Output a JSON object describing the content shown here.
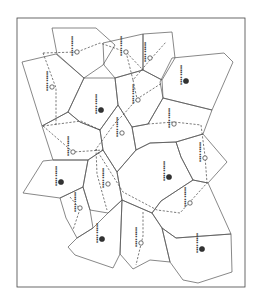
{
  "figure": {
    "frame": {
      "x": 17,
      "y": 18,
      "width": 228,
      "height": 269
    },
    "colors": {
      "line": "#555555",
      "dash": "#444444",
      "marker_fill": "#333333",
      "background": "#ffffff"
    }
  },
  "cells": [
    {
      "id": "c1",
      "points": "52,28 96,28 115,45 103,65 84,78 57,54"
    },
    {
      "id": "c2",
      "points": "103,43 143,34 143,70 115,78 104,65"
    },
    {
      "id": "c3",
      "points": "143,34 172,32 175,58 162,80 143,70"
    },
    {
      "id": "c4",
      "points": "172,58 224,53 233,62 212,110 163,98 160,82"
    },
    {
      "id": "c5",
      "points": "22,62 56,54 84,78 68,112 42,126"
    },
    {
      "id": "c6",
      "points": "84,78 115,78 118,105 100,130 80,122 68,112"
    },
    {
      "id": "c7",
      "points": "115,78 143,70 162,80 163,98 148,124 132,127 118,105"
    },
    {
      "id": "c8",
      "points": "42,126 68,112 80,122 100,130 103,150 88,160 53,160"
    },
    {
      "id": "c9",
      "points": "100,130 118,105 132,127 136,150 117,172 103,150"
    },
    {
      "id": "c10",
      "points": "132,127 148,124 163,98 212,110 203,134 176,142 150,143 136,150"
    },
    {
      "id": "c11",
      "points": "176,142 203,134 227,162 208,183 193,180 181,157"
    },
    {
      "id": "c12",
      "points": "23,193 43,161 53,160 88,160 83,187 60,198"
    },
    {
      "id": "c13",
      "points": "88,160 103,150 117,172 122,200 108,213 90,210 83,187"
    },
    {
      "id": "c14",
      "points": "117,172 136,150 150,143 176,142 181,157 193,180 161,201 152,213 122,200"
    },
    {
      "id": "c15",
      "points": "60,198 83,187 90,210 93,228 77,238 66,218"
    },
    {
      "id": "c16",
      "points": "161,201 193,180 208,183 231,234 176,238 162,228 152,213"
    },
    {
      "id": "c17",
      "points": "77,238 93,228 108,213 122,200 120,254 113,268 75,255 68,247"
    },
    {
      "id": "c18",
      "points": "122,200 152,213 162,228 170,262 150,260 133,269 120,254"
    },
    {
      "id": "c19",
      "points": "162,228 176,238 231,234 232,272 198,283 183,280 170,262"
    }
  ],
  "links": [
    {
      "points": "43,53 77,52 100,43 126,52 143,70"
    },
    {
      "points": "43,53 56,88 56,126"
    },
    {
      "points": "126,52 133,80 150,60 166,42"
    },
    {
      "points": "133,80 137,99 162,83"
    },
    {
      "points": "137,99 123,115 115,123 96,149 97,174 107,210"
    },
    {
      "points": "43,126 81,121 100,130"
    },
    {
      "points": "43,126 73,152 103,150"
    },
    {
      "points": "148,124 174,122 201,125"
    },
    {
      "points": "201,125 205,156 207,183"
    },
    {
      "points": "96,149 123,192 157,210 180,213 207,183"
    },
    {
      "points": "70,197 80,209 73,230"
    },
    {
      "points": "143,212 143,236 136,265"
    }
  ],
  "markers": [
    {
      "label": "Marker A",
      "type": "open",
      "x": 77,
      "y": 52
    },
    {
      "label": "Marker B",
      "type": "open",
      "x": 126,
      "y": 52
    },
    {
      "label": "Marker C",
      "type": "open",
      "x": 150,
      "y": 58
    },
    {
      "label": "Marker D",
      "type": "solid",
      "x": 186,
      "y": 81
    },
    {
      "label": "Marker E",
      "type": "open",
      "x": 52,
      "y": 87
    },
    {
      "label": "Marker F",
      "type": "solid",
      "x": 101,
      "y": 110
    },
    {
      "label": "Marker G",
      "type": "open",
      "x": 138,
      "y": 100
    },
    {
      "label": "Marker H",
      "type": "open",
      "x": 174,
      "y": 124
    },
    {
      "label": "Marker I",
      "type": "open",
      "x": 122,
      "y": 133
    },
    {
      "label": "Marker J",
      "type": "open",
      "x": 73,
      "y": 152
    },
    {
      "label": "Marker K",
      "type": "open",
      "x": 205,
      "y": 158
    },
    {
      "label": "Marker L",
      "type": "solid",
      "x": 61,
      "y": 182
    },
    {
      "label": "Marker M",
      "type": "solid",
      "x": 169,
      "y": 177
    },
    {
      "label": "Marker N",
      "type": "open",
      "x": 108,
      "y": 184
    },
    {
      "label": "Marker O",
      "type": "open",
      "x": 80,
      "y": 208
    },
    {
      "label": "Marker P",
      "type": "open",
      "x": 190,
      "y": 203
    },
    {
      "label": "Marker Q",
      "type": "solid",
      "x": 102,
      "y": 239
    },
    {
      "label": "Marker R",
      "type": "open",
      "x": 141,
      "y": 243
    },
    {
      "label": "Marker S",
      "type": "solid",
      "x": 202,
      "y": 249
    }
  ]
}
